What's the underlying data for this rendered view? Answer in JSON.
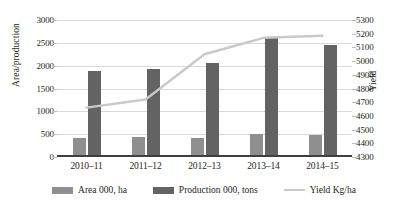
{
  "chart_data": {
    "type": "bar",
    "title": "",
    "subtitle": "",
    "xlabel": "",
    "ylabel": "Area/production",
    "y2label": "Yield",
    "categories": [
      "2010–11",
      "2011–12",
      "2012–13",
      "2013–14",
      "2014–15"
    ],
    "series": [
      {
        "name": "Area 000, ha",
        "type": "bar",
        "axis": "left",
        "color": "#8f8f8f",
        "values": [
          380,
          410,
          380,
          480,
          450
        ]
      },
      {
        "name": "Production 000, tons",
        "type": "bar",
        "axis": "left",
        "color": "#636363",
        "values": [
          1840,
          1900,
          2020,
          2570,
          2430
        ]
      },
      {
        "name": "Yield Kg/ha",
        "type": "line",
        "axis": "right",
        "color": "#c9c9c9",
        "values": [
          4660,
          4720,
          5050,
          5170,
          5185
        ]
      }
    ],
    "ylim": [
      0,
      3000
    ],
    "yticks": [
      0,
      500,
      1000,
      1500,
      2000,
      2500,
      3000
    ],
    "y2lim": [
      4300,
      5300
    ],
    "y2ticks": [
      4300,
      4400,
      4500,
      4600,
      4700,
      4800,
      4900,
      5000,
      5100,
      5200,
      5300
    ],
    "grid": true,
    "legend_position": "bottom"
  },
  "axes": {
    "left_title": "Area/production",
    "right_title": "Yield",
    "left_ticks": [
      "3000",
      "2500",
      "2000",
      "1500",
      "1000",
      "500",
      "0"
    ],
    "right_ticks": [
      "5300",
      "5200",
      "5100",
      "5000",
      "4900",
      "4800",
      "4700",
      "4600",
      "4500",
      "4400",
      "4300"
    ]
  },
  "legend": {
    "items": [
      {
        "label": "Area 000, ha",
        "color": "#8f8f8f",
        "kind": "swatch"
      },
      {
        "label": "Production 000, tons",
        "color": "#636363",
        "kind": "swatch"
      },
      {
        "label": "Yield Kg/ha",
        "color": "#c9c9c9",
        "kind": "line"
      }
    ]
  }
}
